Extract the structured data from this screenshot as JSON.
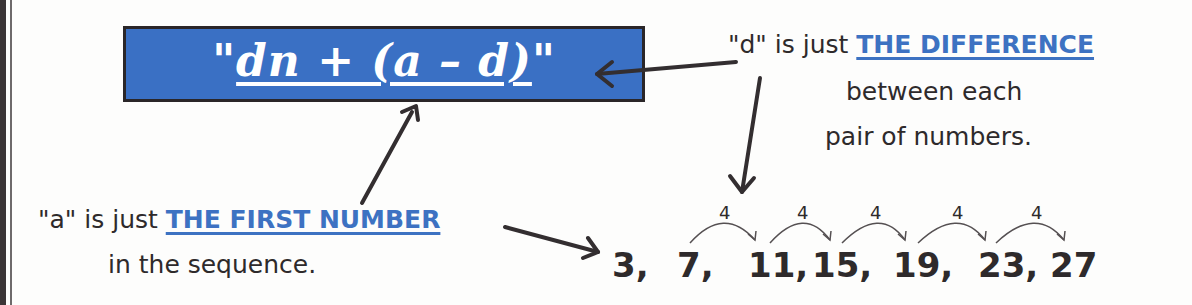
{
  "formula": {
    "open_quote": "\"",
    "expression": "dn + (a – d)",
    "close_quote": "\""
  },
  "d_note": {
    "prefix": "\"d\" is just ",
    "highlight": "THE DIFFERENCE",
    "line2": "between each",
    "line3": "pair of numbers."
  },
  "a_note": {
    "prefix": "\"a\" is just ",
    "highlight": "THE FIRST NUMBER",
    "line2": "in the sequence."
  },
  "sequence": {
    "terms": [
      "3,",
      "7,",
      "11,",
      "15,",
      "19,",
      "23,",
      "27"
    ],
    "differences": [
      "4",
      "4",
      "4",
      "4",
      "4"
    ]
  },
  "colors": {
    "box_blue": "#3a70c4",
    "highlight_blue": "#3d72c2",
    "ink": "#2e2a2b"
  }
}
